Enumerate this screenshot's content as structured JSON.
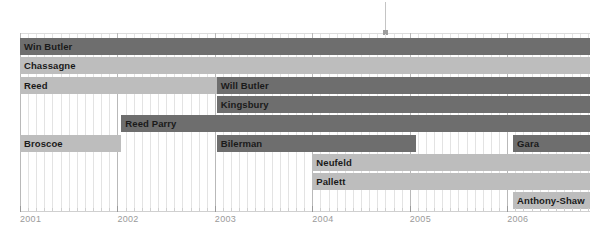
{
  "chart_data": {
    "type": "bar",
    "subtype": "gantt",
    "title": "",
    "xlabel": "",
    "ylabel": "",
    "xlim": [
      2001.0,
      2006.85
    ],
    "grid": true,
    "legend": "none",
    "axis": {
      "tick_labels": [
        "2001",
        "2002",
        "2003",
        "2004",
        "2005",
        "2006"
      ],
      "tick_values": [
        2001,
        2002,
        2003,
        2004,
        2005,
        2006
      ],
      "minor_tick_interval_months": 1
    },
    "annotation": {
      "pointer_x_value": 2004.75,
      "pointer_label": ""
    },
    "colors": {
      "bar_dark": "#6e6e6e",
      "bar_light": "#bdbdbd",
      "grid_minor": "#e3e3e3",
      "grid_major": "#b9b9b9",
      "tick_label": "#9a9a9a",
      "bar_text": "#1a1a1a",
      "background": "#ffffff"
    },
    "categories": [
      "Win Butler",
      "Chassagne",
      "Reed",
      "Will Butler",
      "Kingsbury",
      "Reed Parry",
      "Broscoe",
      "Bilerman",
      "Gara",
      "Neufeld",
      "Pallett",
      "Anthony-Shaw"
    ],
    "tasks": [
      {
        "label": "Win Butler",
        "row": 0,
        "start": 2001.0,
        "end": 2006.85,
        "shade": "dark"
      },
      {
        "label": "Chassagne",
        "row": 1,
        "start": 2001.0,
        "end": 2006.85,
        "shade": "light"
      },
      {
        "label": "Reed",
        "row": 2,
        "start": 2001.0,
        "end": 2003.02,
        "shade": "light"
      },
      {
        "label": "Will Butler",
        "row": 2,
        "start": 2003.02,
        "end": 2006.85,
        "shade": "dark"
      },
      {
        "label": "Kingsbury",
        "row": 3,
        "start": 2003.02,
        "end": 2006.85,
        "shade": "dark"
      },
      {
        "label": "Reed Parry",
        "row": 4,
        "start": 2002.04,
        "end": 2006.85,
        "shade": "dark"
      },
      {
        "label": "Broscoe",
        "row": 5,
        "start": 2001.0,
        "end": 2002.04,
        "shade": "light"
      },
      {
        "label": "Bilerman",
        "row": 5,
        "start": 2003.02,
        "end": 2005.06,
        "shade": "dark"
      },
      {
        "label": "Gara",
        "row": 5,
        "start": 2006.06,
        "end": 2006.85,
        "shade": "dark"
      },
      {
        "label": "Neufeld",
        "row": 6,
        "start": 2004.0,
        "end": 2006.85,
        "shade": "light"
      },
      {
        "label": "Pallett",
        "row": 7,
        "start": 2004.0,
        "end": 2006.85,
        "shade": "light"
      },
      {
        "label": "Anthony-Shaw",
        "row": 8,
        "start": 2006.06,
        "end": 2006.85,
        "shade": "light"
      }
    ]
  }
}
